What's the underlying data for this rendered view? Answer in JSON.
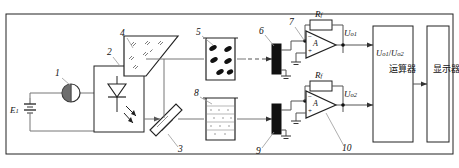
{
  "diagram": {
    "source_label": "E",
    "source_sub": "1",
    "callouts": [
      {
        "id": "1",
        "target": "ammeter-meter"
      },
      {
        "id": "2",
        "target": "light-source-led-box"
      },
      {
        "id": "3",
        "target": "beam-splitter"
      },
      {
        "id": "4",
        "target": "reflector-prism-hopper"
      },
      {
        "id": "5",
        "target": "sample-cuvette"
      },
      {
        "id": "6",
        "target": "photodetector-upper"
      },
      {
        "id": "7",
        "target": "opamp-upper-input-node"
      },
      {
        "id": "8",
        "target": "reference-cuvette"
      },
      {
        "id": "9",
        "target": "photodetector-lower"
      },
      {
        "id": "10",
        "target": "opamp-lower"
      }
    ],
    "feedback_resistor_upper": {
      "symbol": "R",
      "sub": "f"
    },
    "feedback_resistor_lower": {
      "symbol": "R",
      "sub": "f"
    },
    "opamp_upper_symbol": "A",
    "opamp_lower_symbol": "A",
    "opamp_plus": "+",
    "opamp_minus": "−",
    "output_upper": {
      "symbol": "U",
      "sub": "o1"
    },
    "output_lower": {
      "symbol": "U",
      "sub": "o2"
    },
    "processor_block": {
      "formula_num": "U",
      "formula_num_sub": "o1",
      "formula_den": "U",
      "formula_den_sub": "o2",
      "slash": "/",
      "cjk_label": "运算器"
    },
    "display_block": {
      "cjk_label": "显示器"
    },
    "colors": {
      "ink": "#222222",
      "wire": "#777777",
      "detector": "#111111",
      "background": "#ffffff"
    }
  }
}
